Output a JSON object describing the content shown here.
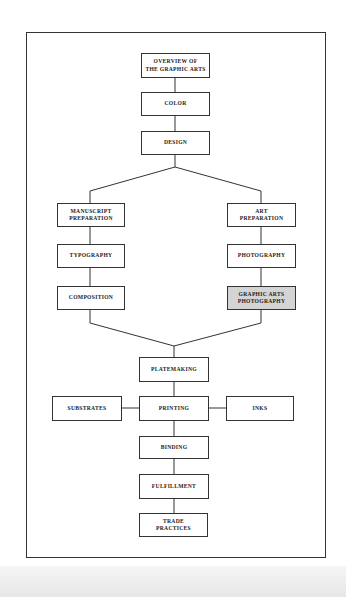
{
  "diagram": {
    "nodes": {
      "overview": "OVERVIEW OF\nTHE GRAPHIC ARTS",
      "color": "COLOR",
      "design": "DESIGN",
      "manuscript": "MANUSCRIPT\nPREPARATION",
      "typography": "TYPOGRAPHY",
      "composition": "COMPOSITION",
      "art_prep": "ART\nPREPARATION",
      "photography": "PHOTOGRAPHY",
      "graphic_arts_photo": "GRAPHIC ARTS\nPHOTOGRAPHY",
      "platemaking": "PLATEMAKING",
      "substrates": "SUBSTRATES",
      "printing": "PRINTING",
      "inks": "INKS",
      "binding": "BINDING",
      "fulfillment": "FULFILLMENT",
      "trade": "TRADE\nPRACTICES"
    },
    "highlighted_node": "graphic_arts_photo",
    "colors": {
      "line": "#333333",
      "highlight_fill": "#d4d4d4"
    }
  }
}
